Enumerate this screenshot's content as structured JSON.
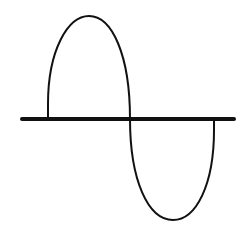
{
  "diagram": {
    "type": "sine-wave-single-cycle",
    "colors": {
      "stroke": "#111111",
      "background": "#ffffff"
    },
    "axis": {
      "x1": 22,
      "x2": 234,
      "y": 119
    },
    "wave": {
      "start_x": 48,
      "mid_x": 130,
      "end_x": 214,
      "peak": {
        "x": 89,
        "y": 16
      },
      "trough": {
        "x": 173,
        "y": 220
      }
    }
  }
}
